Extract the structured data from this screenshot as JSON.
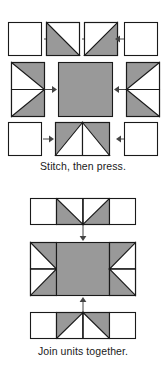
{
  "document": {
    "title": "Quilt block unit assembly",
    "colors": {
      "fabric_light": "#ffffff",
      "fabric_dark": "#999999",
      "outline": "#1a1a1a",
      "arrow": "#444444",
      "text": "#1a1a1a",
      "background": "#ffffff"
    }
  },
  "diagrams": [
    {
      "id": "stitch-then-press",
      "caption": "Stitch, then press.",
      "rows": [
        {
          "id": "row-top",
          "name": "corner-and-half-square-triangle-row",
          "units": [
            {
              "name": "plain-square-left",
              "type": "plain-square",
              "fabric": "light"
            },
            {
              "name": "arrow-right-1",
              "type": "arrow",
              "direction": "right"
            },
            {
              "name": "half-square-triangle-left",
              "type": "half-square-triangle",
              "dark_corner": "bottom-left"
            },
            {
              "name": "arrow-right-2",
              "type": "arrow",
              "direction": "right"
            },
            {
              "name": "half-square-triangle-right",
              "type": "half-square-triangle",
              "dark_corner": "bottom-right"
            },
            {
              "name": "arrow-left-1",
              "type": "arrow",
              "direction": "left"
            },
            {
              "name": "plain-square-right",
              "type": "plain-square",
              "fabric": "light"
            }
          ]
        },
        {
          "id": "row-middle",
          "name": "flying-geese-and-center-square-row",
          "units": [
            {
              "name": "flying-geese-pair-left",
              "type": "flying-geese-pair-vertical",
              "point": "right"
            },
            {
              "name": "arrow-right-3",
              "type": "arrow",
              "direction": "right"
            },
            {
              "name": "center-square",
              "type": "plain-square",
              "fabric": "dark"
            },
            {
              "name": "arrow-left-2",
              "type": "arrow",
              "direction": "left"
            },
            {
              "name": "flying-geese-pair-right",
              "type": "flying-geese-pair-vertical",
              "point": "left"
            }
          ]
        },
        {
          "id": "row-bottom",
          "name": "corner-and-flying-geese-row",
          "units": [
            {
              "name": "plain-square-left-2",
              "type": "plain-square",
              "fabric": "light"
            },
            {
              "name": "arrow-right-4",
              "type": "arrow",
              "direction": "right"
            },
            {
              "name": "flying-geese-pair-bottom",
              "type": "flying-geese-pair-horizontal",
              "point": "up"
            },
            {
              "name": "arrow-left-3",
              "type": "arrow",
              "direction": "left"
            },
            {
              "name": "plain-square-right-2",
              "type": "plain-square",
              "fabric": "light"
            }
          ]
        }
      ]
    },
    {
      "id": "join-units-together",
      "caption": "Join units together.",
      "rows": [
        {
          "id": "joined-row-top",
          "name": "top-unit-row",
          "units": [
            {
              "name": "plain-square-left-3",
              "type": "plain-square",
              "fabric": "light"
            },
            {
              "name": "flying-geese-pair-down",
              "type": "flying-geese-pair-horizontal",
              "point": "down"
            },
            {
              "name": "plain-square-right-3",
              "type": "plain-square",
              "fabric": "light"
            }
          ]
        },
        {
          "id": "arrow-down",
          "name": "arrow-down-1",
          "type": "arrow",
          "direction": "down"
        },
        {
          "id": "joined-row-middle",
          "name": "middle-unit-row",
          "units": [
            {
              "name": "flying-geese-pair-left-2",
              "type": "flying-geese-pair-vertical",
              "point": "right"
            },
            {
              "name": "center-square-2",
              "type": "plain-square",
              "fabric": "dark"
            },
            {
              "name": "flying-geese-pair-right-2",
              "type": "flying-geese-pair-vertical",
              "point": "left"
            }
          ]
        },
        {
          "id": "arrow-up",
          "name": "arrow-up-1",
          "type": "arrow",
          "direction": "up"
        },
        {
          "id": "joined-row-bottom",
          "name": "bottom-unit-row",
          "units": [
            {
              "name": "plain-square-left-4",
              "type": "plain-square",
              "fabric": "light"
            },
            {
              "name": "flying-geese-pair-up",
              "type": "flying-geese-pair-horizontal",
              "point": "up"
            },
            {
              "name": "plain-square-right-4",
              "type": "plain-square",
              "fabric": "light"
            }
          ]
        }
      ]
    }
  ]
}
